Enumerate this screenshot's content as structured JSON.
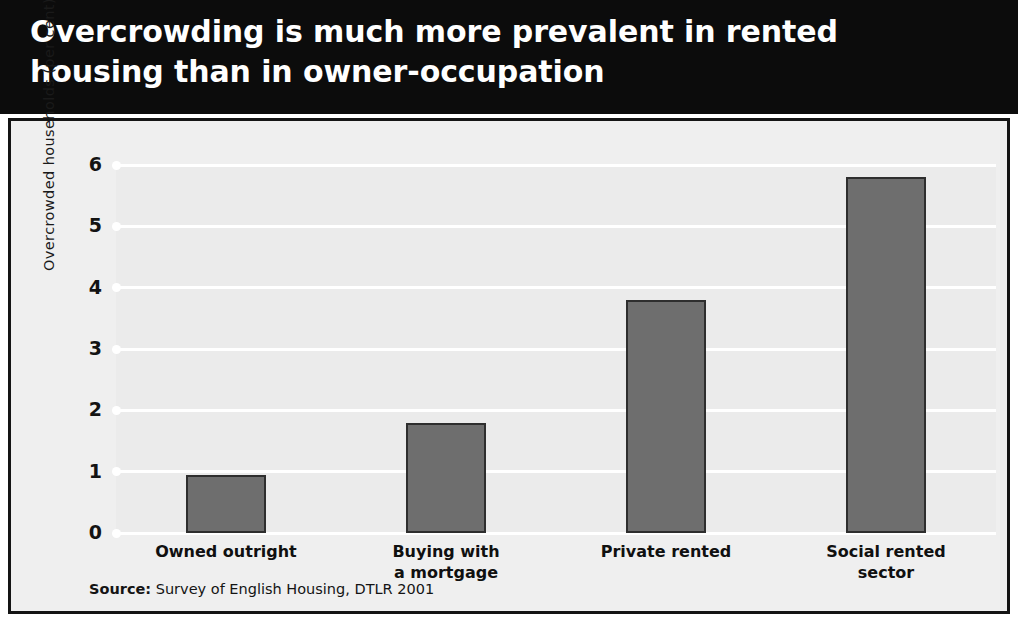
{
  "title": {
    "line1": "Overcrowding is much more prevalent in rented",
    "line2": "housing than in owner-occupation"
  },
  "source": {
    "label": "Source:",
    "text": " Survey of English Housing, DTLR 2001"
  },
  "colors": {
    "title_band": "#0c0c0c",
    "title_text": "#ffffff",
    "panel_background": "#efefef",
    "plot_background": "#ebebeb",
    "gridline": "#ffffff",
    "bar_fill": "#6e6e6e",
    "bar_stroke": "#2e2e2e",
    "border": "#141414",
    "axis_text": "#131313"
  },
  "chart_data": {
    "type": "bar",
    "title": "Overcrowding is much more prevalent in rented housing than in owner-occupation",
    "subtitle": "",
    "xlabel": "",
    "ylabel": "Overcrowded households (per cent)",
    "ylim": [
      0,
      6
    ],
    "yticks": [
      0,
      1,
      2,
      3,
      4,
      5,
      6
    ],
    "ytick_labels": [
      "0",
      "1",
      "2",
      "3",
      "4",
      "5",
      "6"
    ],
    "grid": true,
    "legend": false,
    "legend_position": "none",
    "categories": [
      "Owned outright",
      "Buying with a mortgage",
      "Private rented",
      "Social rented sector"
    ],
    "category_label_lines": [
      [
        "Owned outright"
      ],
      [
        "Buying with",
        "a mortgage"
      ],
      [
        "Private rented"
      ],
      [
        "Social rented",
        "sector"
      ]
    ],
    "values": [
      0.95,
      1.8,
      3.8,
      5.8
    ],
    "source": "Survey of English Housing, DTLR 2001"
  }
}
